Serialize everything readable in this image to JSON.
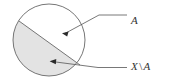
{
  "figure": {
    "name": "set-difference-venn-diagram",
    "type": "set-diagram",
    "width": 175,
    "height": 84,
    "background_color": "#ffffff"
  },
  "shapes": {
    "circle": {
      "name": "universe-circle",
      "center_x": 49,
      "center_y": 40,
      "radius": 36,
      "stroke_color": "#666666",
      "stroke_width": 0.9,
      "fill_color": "#ffffff"
    },
    "chord": {
      "name": "dividing-chord",
      "x1": 19,
      "y1": 21,
      "x2": 80,
      "y2": 65,
      "stroke_color": "#666666",
      "stroke_width": 0.9
    },
    "shaded_region": {
      "name": "complement-region",
      "fill_color": "#e3e3e3",
      "description": "lower-left segment of circle"
    },
    "unshaded_region": {
      "name": "subset-region",
      "fill_color": "#ffffff",
      "description": "upper-right segment of circle"
    }
  },
  "leaders": {
    "upper": {
      "name": "leader-line-a",
      "arrow_tip_x": 63,
      "arrow_tip_y": 34,
      "bend_x": 99,
      "bend_y": 15,
      "end_x": 127,
      "end_y": 15,
      "stroke_color": "#555555"
    },
    "lower": {
      "name": "leader-line-x-minus-a",
      "arrow_tip_x": 50,
      "arrow_tip_y": 61,
      "bend_x": 98,
      "bend_y": 67,
      "end_x": 127,
      "end_y": 67,
      "stroke_color": "#555555"
    }
  },
  "labels": {
    "upper": {
      "name": "label-a",
      "text": "A"
    },
    "lower": {
      "name": "label-x-minus-a",
      "set_name": "X",
      "operator": "\\",
      "subset_name": "A",
      "full_text": "X \\ A"
    }
  },
  "colors": {
    "stroke": "#666666",
    "shade": "#e3e3e3",
    "text": "#333333",
    "background": "#ffffff"
  }
}
